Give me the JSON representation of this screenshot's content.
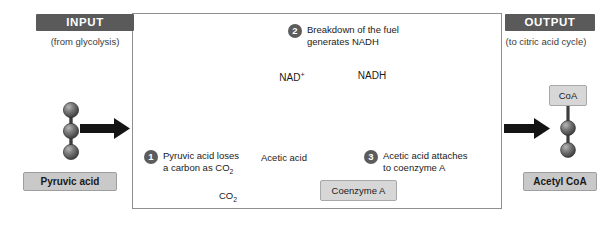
{
  "diagram": {
    "colors": {
      "banner_bg": "#5a5a5a",
      "banner_text": "#ffffff",
      "chip_bg": "#c9c9c9",
      "chip_border": "#9e9e9e",
      "molbox_bg": "#d7d7d7",
      "molbox_border": "#a8a8a8",
      "arrow_light": "#c4c4c4",
      "arrow_dark": "#1a1a1a",
      "sphere_dark": "#4a4a4a",
      "panel_border": "#8f8f8f",
      "step_badge": "#5c5c5c",
      "curve_line": "#b5b5b5"
    }
  },
  "input": {
    "banner_label": "INPUT",
    "sublabel": "(from glycolysis)",
    "molecule_label": "Pyruvic acid",
    "sphere_count": 3
  },
  "output": {
    "banner_label": "OUTPUT",
    "sublabel": "(to citric acid cycle)",
    "molecule_label": "Acetyl CoA",
    "coa_label": "CoA",
    "sphere_count": 2
  },
  "steps": [
    {
      "number": "1",
      "line1": "Pyruvic acid loses",
      "line2": "a carbon as CO"
    },
    {
      "number": "2",
      "line1": "Breakdown of the fuel",
      "line2": "generates NADH"
    },
    {
      "number": "3",
      "line1": "Acetic acid attaches",
      "line2": "to coenzyme A"
    }
  ],
  "molecules": {
    "nad_plus": {
      "label": "NAD",
      "charge": "+",
      "notches": 2,
      "electrons_present": false
    },
    "nadh": {
      "label": "NADH",
      "notches": 2,
      "electrons_present": true,
      "electron_glyph": "−",
      "electron_count": 2
    },
    "acetic_acid": {
      "label": "Acetic acid",
      "sphere_count": 2
    },
    "carbon_dioxide": {
      "label": "CO",
      "subscript": "2",
      "sphere_count": 1
    },
    "coenzyme_a": {
      "label": "Coenzyme A"
    }
  },
  "subscripts": {
    "co2_sub": "2"
  }
}
